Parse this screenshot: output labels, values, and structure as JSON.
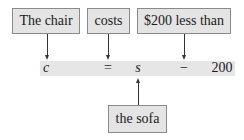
{
  "labels": {
    "chair": "The chair",
    "costs": "costs",
    "less_than": "$200 less than",
    "sofa": "the sofa"
  },
  "equation": {
    "lhs": "c",
    "equals": "=",
    "var": "s",
    "minus": "−",
    "constant": "200"
  },
  "colors": {
    "box_fill": "#e4e4e4",
    "box_border": "#8a8a8a",
    "band_fill": "#e6e6e6",
    "arrow": "#333333"
  }
}
